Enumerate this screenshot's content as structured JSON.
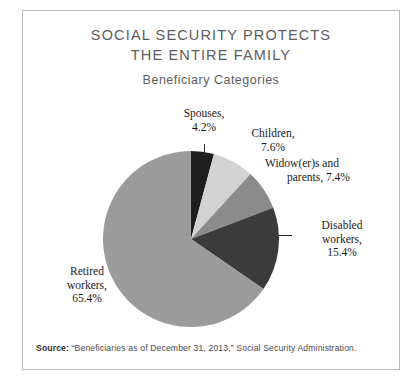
{
  "figure": {
    "title_lines": [
      "SOCIAL SECURITY PROTECTS",
      "THE ENTIRE FAMILY"
    ],
    "subtitle": "Beneficiary Categories",
    "source_label": "Source:",
    "source_text": " “Beneficiaries as of December 31, 2013,” Social Security Administration.",
    "border_color": "#b9b9b9",
    "background": "#ffffff",
    "title_color": "#5d5d5d"
  },
  "chart_data": {
    "type": "pie",
    "title": "SOCIAL SECURITY PROTECTS THE ENTIRE FAMILY",
    "subtitle": "Beneficiary Categories",
    "categories": [
      "Spouses",
      "Children",
      "Widow(er)s and parents",
      "Disabled workers",
      "Retired workers"
    ],
    "values": [
      4.2,
      7.6,
      7.4,
      15.4,
      65.4
    ],
    "value_unit": "%",
    "colors": [
      "#1e1e1e",
      "#d2d2d2",
      "#8b8b8b",
      "#3b3b3b",
      "#9b9b9b"
    ],
    "start_angle_deg": 0,
    "direction": "clockwise",
    "legend": "none",
    "labels": [
      {
        "name": "Spouses",
        "text_line1": "Spouses,",
        "text_line2": "4.2%",
        "value": 4.2,
        "color": "#1e1e1e"
      },
      {
        "name": "Children",
        "text_line1": "Children,",
        "text_line2": "7.6%",
        "value": 7.6,
        "color": "#d2d2d2"
      },
      {
        "name": "Widow(er)s and parents",
        "text_line1": "Widow(er)s and",
        "text_line2": "parents, 7.4%",
        "value": 7.4,
        "color": "#8b8b8b"
      },
      {
        "name": "Disabled workers",
        "text_line1": "Disabled",
        "text_line2": "workers,",
        "text_line3": "15.4%",
        "value": 15.4,
        "color": "#3b3b3b"
      },
      {
        "name": "Retired workers",
        "text_line1": "Retired",
        "text_line2": "workers,",
        "text_line3": "65.4%",
        "value": 65.4,
        "color": "#9b9b9b"
      }
    ],
    "geometry": {
      "cx": 168,
      "cy": 228,
      "r": 88
    }
  }
}
